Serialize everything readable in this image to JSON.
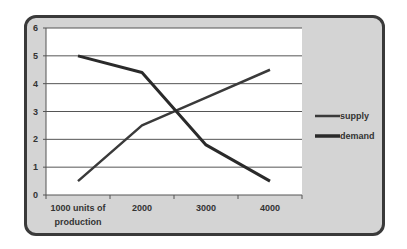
{
  "chart_data": {
    "type": "line",
    "title": "",
    "xlabel": "",
    "ylabel": "",
    "categories": [
      "1000 units of production",
      "2000",
      "3000",
      "4000"
    ],
    "category_lines": [
      [
        "1000 units of",
        "production"
      ],
      [
        "2000"
      ],
      [
        "3000"
      ],
      [
        "4000"
      ]
    ],
    "series": [
      {
        "name": "supply",
        "values": [
          0.5,
          2.5,
          3.5,
          4.5
        ],
        "color": "#3a3a3a"
      },
      {
        "name": "demand",
        "values": [
          5,
          4.4,
          1.8,
          0.5
        ],
        "color": "#2a2a2a"
      }
    ],
    "ylim": [
      0,
      6
    ],
    "yticks": [
      0,
      1,
      2,
      3,
      4,
      5,
      6
    ],
    "grid": true,
    "legend_position": "right"
  },
  "legend": {
    "items": [
      {
        "label": "supply"
      },
      {
        "label": "demand"
      }
    ]
  },
  "colors": {
    "frame_bg": "#d4d4d4",
    "plot_bg": "#ffffff",
    "line": "#333333"
  }
}
